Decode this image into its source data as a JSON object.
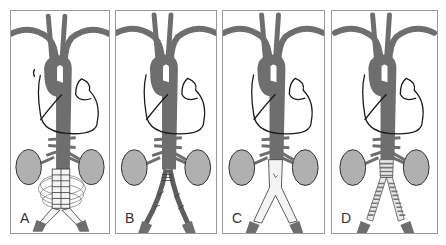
{
  "figure": {
    "panels": [
      {
        "id": "A",
        "label": "A",
        "graft": "stent-graft-in-aneurysm-sac"
      },
      {
        "id": "B",
        "label": "B",
        "graft": "sutured-native-iliacs"
      },
      {
        "id": "C",
        "label": "C",
        "graft": "bifurcated-white-graft"
      },
      {
        "id": "D",
        "label": "D",
        "graft": "ringed-bifurcated-graft"
      }
    ],
    "colors": {
      "vessel": "#6e6e6e",
      "vessel_dark": "#555555",
      "outline": "#1a1a1a",
      "kidney": "#a9a9a9",
      "kidney_light": "#d4d4d4",
      "graft_white": "#f4f4f4",
      "border": "#9a9a9a",
      "background": "#ffffff"
    }
  }
}
